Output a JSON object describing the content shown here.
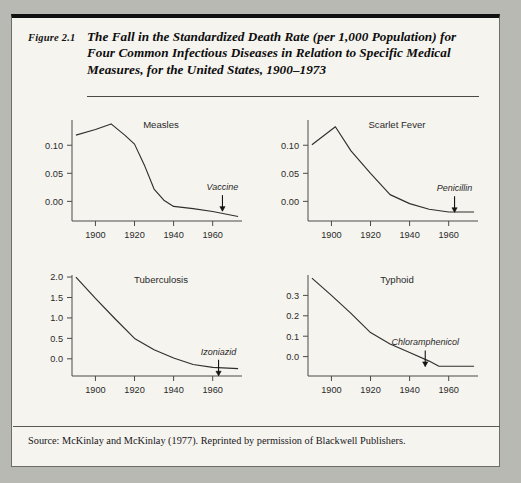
{
  "figure": {
    "number_label": "Figure 2.1",
    "title": "The Fall in the Standardized Death Rate (per 1,000 Population) for Four Common Infectious Diseases in Relation to Specific Medical Measures, for the United States, 1900–1973",
    "source": "Source: McKinlay and McKinlay (1977). Reprinted by permission of Blackwell Publishers."
  },
  "chart_data": [
    {
      "type": "line",
      "title": "Measles",
      "xlabel": "",
      "ylabel": "",
      "xlim": [
        1888,
        1975
      ],
      "ylim": [
        -0.035,
        0.145
      ],
      "xticks": [
        1900,
        1920,
        1940,
        1960
      ],
      "xtick_labels": [
        "1900",
        "1920",
        "1940",
        "1960"
      ],
      "yticks": [
        0.0,
        0.05,
        0.1
      ],
      "ytick_labels": [
        "0.00",
        "0.05",
        "0.10"
      ],
      "grid": false,
      "legend": "none",
      "x": [
        1890,
        1900,
        1908,
        1915,
        1920,
        1925,
        1930,
        1935,
        1940,
        1950,
        1960,
        1973
      ],
      "values": [
        0.118,
        0.128,
        0.138,
        0.118,
        0.102,
        0.065,
        0.022,
        0.002,
        -0.009,
        -0.013,
        -0.018,
        -0.027
      ],
      "annotation": {
        "label": "Vaccine",
        "x": 1965,
        "y": 0.02
      }
    },
    {
      "type": "line",
      "title": "Scarlet Fever",
      "xlabel": "",
      "ylabel": "",
      "xlim": [
        1888,
        1975
      ],
      "ylim": [
        -0.035,
        0.145
      ],
      "xticks": [
        1900,
        1920,
        1940,
        1960
      ],
      "xtick_labels": [
        "1900",
        "1920",
        "1940",
        "1960"
      ],
      "yticks": [
        0.0,
        0.05,
        0.1
      ],
      "ytick_labels": [
        "0.00",
        "0.05",
        "0.10"
      ],
      "grid": false,
      "legend": "none",
      "x": [
        1890,
        1902,
        1910,
        1920,
        1930,
        1940,
        1950,
        1960,
        1973
      ],
      "values": [
        0.101,
        0.133,
        0.09,
        0.05,
        0.012,
        -0.004,
        -0.014,
        -0.019,
        -0.019
      ],
      "annotation": {
        "label": "Penicillin",
        "x": 1963,
        "y": 0.018
      }
    },
    {
      "type": "line",
      "title": "Tuberculosis",
      "xlabel": "",
      "ylabel": "",
      "xlim": [
        1888,
        1975
      ],
      "ylim": [
        -0.42,
        2.05
      ],
      "xticks": [
        1900,
        1920,
        1940,
        1960
      ],
      "xtick_labels": [
        "1900",
        "1920",
        "1940",
        "1960"
      ],
      "yticks": [
        0.0,
        0.5,
        1.0,
        1.5,
        2.0
      ],
      "ytick_labels": [
        "0.0",
        "0.5",
        "1.0",
        "1.5",
        "2.0"
      ],
      "grid": false,
      "legend": "none",
      "x": [
        1890,
        1900,
        1910,
        1920,
        1930,
        1940,
        1950,
        1960,
        1973
      ],
      "values": [
        2.0,
        1.48,
        0.98,
        0.5,
        0.22,
        0.02,
        -0.14,
        -0.21,
        -0.24
      ],
      "annotation": {
        "label": "Izoniazid",
        "x": 1963,
        "y": 0.1
      }
    },
    {
      "type": "line",
      "title": "Typhoid",
      "xlabel": "",
      "ylabel": "",
      "xlim": [
        1888,
        1975
      ],
      "ylim": [
        -0.095,
        0.4
      ],
      "xticks": [
        1900,
        1920,
        1940,
        1960
      ],
      "xtick_labels": [
        "1900",
        "1920",
        "1940",
        "1960"
      ],
      "yticks": [
        0.0,
        0.1,
        0.2,
        0.3
      ],
      "ytick_labels": [
        "0.0",
        "0.1",
        "0.2",
        "0.3"
      ],
      "grid": false,
      "legend": "none",
      "x": [
        1890,
        1900,
        1910,
        1920,
        1930,
        1940,
        1950,
        1955,
        1965,
        1973
      ],
      "values": [
        0.385,
        0.3,
        0.212,
        0.118,
        0.062,
        0.02,
        -0.022,
        -0.047,
        -0.047,
        -0.047
      ],
      "annotation": {
        "label": "Chloramphenicol",
        "x": 1948,
        "y": 0.055
      }
    }
  ]
}
